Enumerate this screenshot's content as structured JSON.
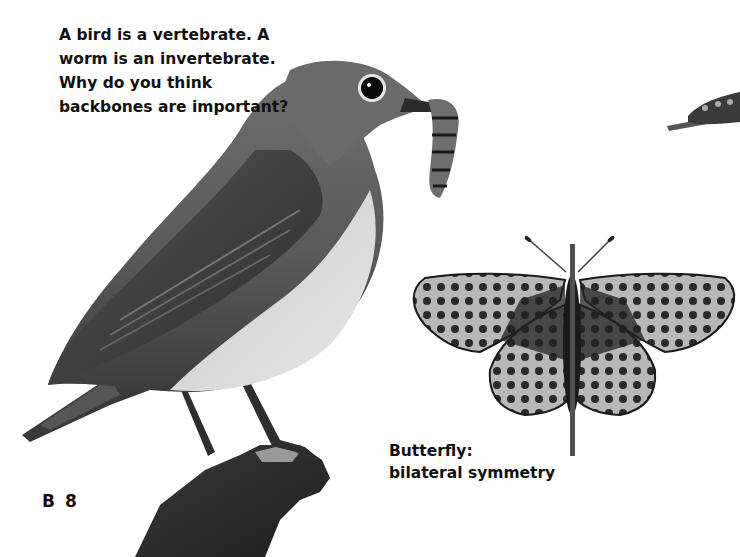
{
  "question": {
    "lines": [
      "A bird is a vertebrate. A",
      "worm is an invertebrate.",
      "Why do you think",
      "backbones are important?"
    ]
  },
  "butterfly_caption": {
    "lines": [
      "Butterfly:",
      "bilateral symmetry"
    ]
  },
  "page_number": "B 8",
  "images": {
    "bird": "bird-with-worm-photo",
    "butterfly": "butterfly-photo",
    "caterpillar": "caterpillar-on-twig-photo"
  },
  "colors": {
    "symmetry_line": "#505050",
    "text": "#111111"
  }
}
